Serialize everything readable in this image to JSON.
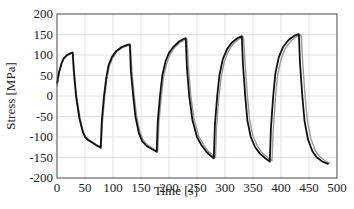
{
  "chart_data": {
    "type": "line",
    "title": "",
    "xlabel": "Time [s]",
    "ylabel": "Stress [MPa]",
    "xlim": [
      0,
      500
    ],
    "ylim": [
      -200,
      200
    ],
    "xticks": [
      0,
      50,
      100,
      150,
      200,
      250,
      300,
      350,
      400,
      450,
      500
    ],
    "yticks": [
      200,
      150,
      100,
      50,
      0,
      -50,
      -100,
      -150,
      -200
    ],
    "grid": true,
    "legend": null,
    "series": [
      {
        "name": "measured",
        "color": "#111111",
        "x": [
          0,
          4,
          8,
          12,
          18,
          24,
          28,
          30,
          34,
          40,
          46,
          50,
          56,
          62,
          70,
          78,
          80,
          84,
          88,
          92,
          98,
          106,
          116,
          126,
          130,
          132,
          136,
          140,
          146,
          152,
          160,
          170,
          178,
          180,
          184,
          188,
          194,
          200,
          208,
          218,
          226,
          230,
          232,
          236,
          242,
          250,
          258,
          266,
          274,
          280,
          282,
          286,
          290,
          296,
          304,
          312,
          322,
          330,
          332,
          336,
          340,
          346,
          354,
          362,
          372,
          380,
          382,
          386,
          390,
          396,
          404,
          414,
          424,
          432,
          434,
          438,
          442,
          448,
          456,
          464,
          474,
          485
        ],
        "y": [
          30,
          60,
          80,
          92,
          100,
          104,
          106,
          60,
          0,
          -55,
          -88,
          -100,
          -108,
          -113,
          -120,
          -126,
          -60,
          0,
          45,
          75,
          95,
          110,
          120,
          125,
          126,
          60,
          0,
          -50,
          -90,
          -110,
          -122,
          -130,
          -136,
          -60,
          0,
          50,
          85,
          105,
          120,
          133,
          139,
          141,
          70,
          0,
          -60,
          -100,
          -120,
          -135,
          -145,
          -152,
          -70,
          0,
          50,
          90,
          115,
          130,
          141,
          146,
          80,
          0,
          -60,
          -100,
          -125,
          -140,
          -152,
          -160,
          -80,
          0,
          55,
          95,
          120,
          137,
          147,
          151,
          80,
          0,
          -60,
          -105,
          -135,
          -150,
          -160,
          -166
        ]
      },
      {
        "name": "simulated",
        "color": "#999999",
        "x": [
          0,
          4,
          8,
          12,
          18,
          24,
          28,
          31,
          35,
          41,
          47,
          51,
          57,
          63,
          71,
          79,
          81,
          85,
          89,
          93,
          99,
          107,
          117,
          127,
          131,
          134,
          138,
          142,
          148,
          154,
          162,
          172,
          180,
          182,
          186,
          190,
          196,
          202,
          210,
          220,
          228,
          232,
          235,
          239,
          245,
          253,
          261,
          269,
          277,
          283,
          285,
          289,
          293,
          299,
          307,
          315,
          325,
          333,
          336,
          340,
          344,
          350,
          358,
          366,
          376,
          384,
          386,
          390,
          394,
          400,
          408,
          418,
          428,
          436,
          439,
          443,
          447,
          453,
          461,
          469,
          479,
          488
        ],
        "y": [
          25,
          55,
          76,
          90,
          99,
          103,
          104,
          58,
          0,
          -53,
          -86,
          -99,
          -107,
          -112,
          -119,
          -124,
          -65,
          -5,
          40,
          70,
          92,
          108,
          118,
          123,
          124,
          58,
          0,
          -48,
          -88,
          -108,
          -120,
          -128,
          -134,
          -65,
          -5,
          45,
          80,
          102,
          118,
          131,
          137,
          139,
          68,
          0,
          -58,
          -98,
          -118,
          -133,
          -143,
          -150,
          -75,
          -5,
          45,
          85,
          112,
          128,
          139,
          144,
          78,
          0,
          -58,
          -98,
          -123,
          -138,
          -150,
          -158,
          -85,
          -5,
          50,
          90,
          117,
          135,
          145,
          149,
          78,
          0,
          -58,
          -103,
          -133,
          -148,
          -158,
          -164
        ]
      }
    ]
  },
  "axes": {
    "xlabel": "Time [s]",
    "ylabel": "Stress [MPa]"
  }
}
